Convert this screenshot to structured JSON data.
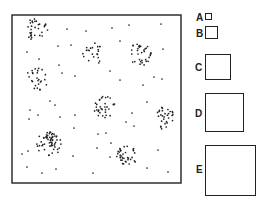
{
  "field": {
    "frame": {
      "x": 12,
      "y": 15,
      "w": 169,
      "h": 168
    },
    "dot_color": "#222222",
    "clusters": [
      {
        "cx": 36,
        "cy": 30,
        "rx": 12,
        "ry": 12,
        "n": 32
      },
      {
        "cx": 92,
        "cy": 54,
        "rx": 11,
        "ry": 12,
        "n": 22
      },
      {
        "cx": 140,
        "cy": 54,
        "rx": 11,
        "ry": 12,
        "n": 34
      },
      {
        "cx": 37,
        "cy": 80,
        "rx": 12,
        "ry": 12,
        "n": 26
      },
      {
        "cx": 104,
        "cy": 107,
        "rx": 11,
        "ry": 11,
        "n": 32
      },
      {
        "cx": 165,
        "cy": 118,
        "rx": 10,
        "ry": 12,
        "n": 30
      },
      {
        "cx": 49,
        "cy": 144,
        "rx": 13,
        "ry": 12,
        "n": 60
      },
      {
        "cx": 127,
        "cy": 156,
        "rx": 11,
        "ry": 11,
        "n": 36
      }
    ],
    "scatter": [
      [
        67,
        29
      ],
      [
        86,
        31
      ],
      [
        112,
        28
      ],
      [
        129,
        25
      ],
      [
        161,
        24
      ],
      [
        27,
        52
      ],
      [
        39,
        59
      ],
      [
        58,
        46
      ],
      [
        71,
        45
      ],
      [
        120,
        41
      ],
      [
        163,
        49
      ],
      [
        59,
        65
      ],
      [
        62,
        73
      ],
      [
        75,
        76
      ],
      [
        110,
        71
      ],
      [
        120,
        80
      ],
      [
        154,
        77
      ],
      [
        162,
        79
      ],
      [
        143,
        85
      ],
      [
        50,
        101
      ],
      [
        55,
        105
      ],
      [
        30,
        110
      ],
      [
        29,
        119
      ],
      [
        38,
        115
      ],
      [
        60,
        117
      ],
      [
        75,
        115
      ],
      [
        147,
        102
      ],
      [
        132,
        113
      ],
      [
        126,
        122
      ],
      [
        134,
        126
      ],
      [
        74,
        128
      ],
      [
        98,
        134
      ],
      [
        106,
        133
      ],
      [
        111,
        143
      ],
      [
        97,
        148
      ],
      [
        110,
        157
      ],
      [
        158,
        150
      ],
      [
        22,
        154
      ],
      [
        28,
        151
      ],
      [
        73,
        156
      ],
      [
        27,
        167
      ],
      [
        42,
        173
      ],
      [
        56,
        169
      ],
      [
        93,
        173
      ],
      [
        147,
        168
      ],
      [
        168,
        172
      ]
    ]
  },
  "quadrats": [
    {
      "label": "A",
      "box": {
        "x": 205,
        "y": 13,
        "w": 7,
        "h": 7
      },
      "label_pos": {
        "x": 196,
        "y": 13
      }
    },
    {
      "label": "B",
      "box": {
        "x": 205,
        "y": 26,
        "w": 13,
        "h": 13
      },
      "label_pos": {
        "x": 196,
        "y": 29
      }
    },
    {
      "label": "C",
      "box": {
        "x": 205,
        "y": 54,
        "w": 26,
        "h": 26
      },
      "label_pos": {
        "x": 195,
        "y": 63
      }
    },
    {
      "label": "D",
      "box": {
        "x": 205,
        "y": 93,
        "w": 39,
        "h": 39
      },
      "label_pos": {
        "x": 195,
        "y": 109
      }
    },
    {
      "label": "E",
      "box": {
        "x": 205,
        "y": 145,
        "w": 51,
        "h": 51
      },
      "label_pos": {
        "x": 196,
        "y": 165
      }
    }
  ]
}
